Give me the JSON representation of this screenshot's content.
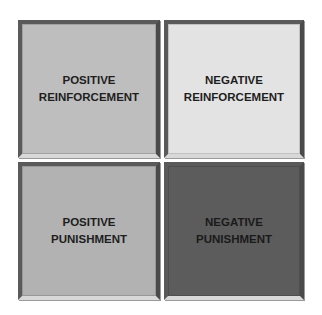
{
  "diagram": {
    "type": "2x2 matrix",
    "cells": [
      {
        "line1": "POSITIVE",
        "line2": "REINFORCEMENT",
        "fill": "#bebebe",
        "text_color": "#1e1e1e"
      },
      {
        "line1": "NEGATIVE",
        "line2": "REINFORCEMENT",
        "fill": "#e3e3e3",
        "text_color": "#1e1e1e"
      },
      {
        "line1": "POSITIVE",
        "line2": "PUNISHMENT",
        "fill": "#b2b2b2",
        "text_color": "#1e1e1e"
      },
      {
        "line1": "NEGATIVE",
        "line2": "PUNISHMENT",
        "fill": "#5c5c5c",
        "text_color": "#1a1a1a"
      }
    ]
  }
}
